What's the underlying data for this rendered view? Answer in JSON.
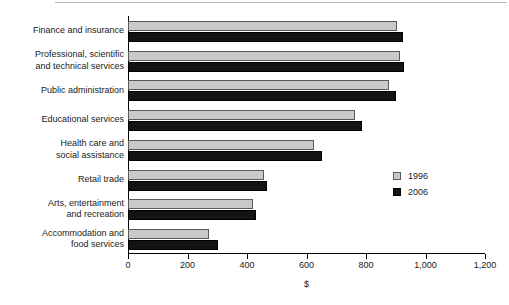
{
  "chart_data": {
    "type": "bar",
    "orientation": "horizontal",
    "title": "",
    "subtitle": "",
    "xlabel": "$",
    "ylabel": "",
    "xlim": [
      0,
      1200
    ],
    "xticks": [
      0,
      200,
      400,
      600,
      800,
      1000,
      1200
    ],
    "xtick_labels": [
      "0",
      "200",
      "400",
      "600",
      "800",
      "1,000",
      "1,200"
    ],
    "grid": false,
    "legend_position": "center-right",
    "categories": [
      "Finance and insurance",
      "Professional, scientific and technical services",
      "Public administration",
      "Educational services",
      "Health care and social assistance",
      "Retail trade",
      "Arts, entertainment and recreation",
      "Accommodation and food services"
    ],
    "category_lines": [
      [
        "Finance and insurance"
      ],
      [
        "Professional, scientific",
        "and technical services"
      ],
      [
        "Public administration"
      ],
      [
        "Educational services"
      ],
      [
        "Health care and",
        "social assistance"
      ],
      [
        "Retail trade"
      ],
      [
        "Arts, entertainment",
        "and recreation"
      ],
      [
        "Accommodation and",
        "food services"
      ]
    ],
    "series": [
      {
        "name": "1996",
        "color": "#c9c9c9",
        "values": [
          905,
          915,
          877,
          763,
          625,
          457,
          420,
          272
        ]
      },
      {
        "name": "2006",
        "color": "#141414",
        "values": [
          925,
          928,
          900,
          787,
          652,
          467,
          430,
          302
        ]
      }
    ]
  },
  "legend": {
    "items": [
      {
        "label": "1996",
        "swatch": "light-gray-square"
      },
      {
        "label": "2006",
        "swatch": "black-square"
      }
    ]
  },
  "axis": {
    "x_title": "$"
  }
}
